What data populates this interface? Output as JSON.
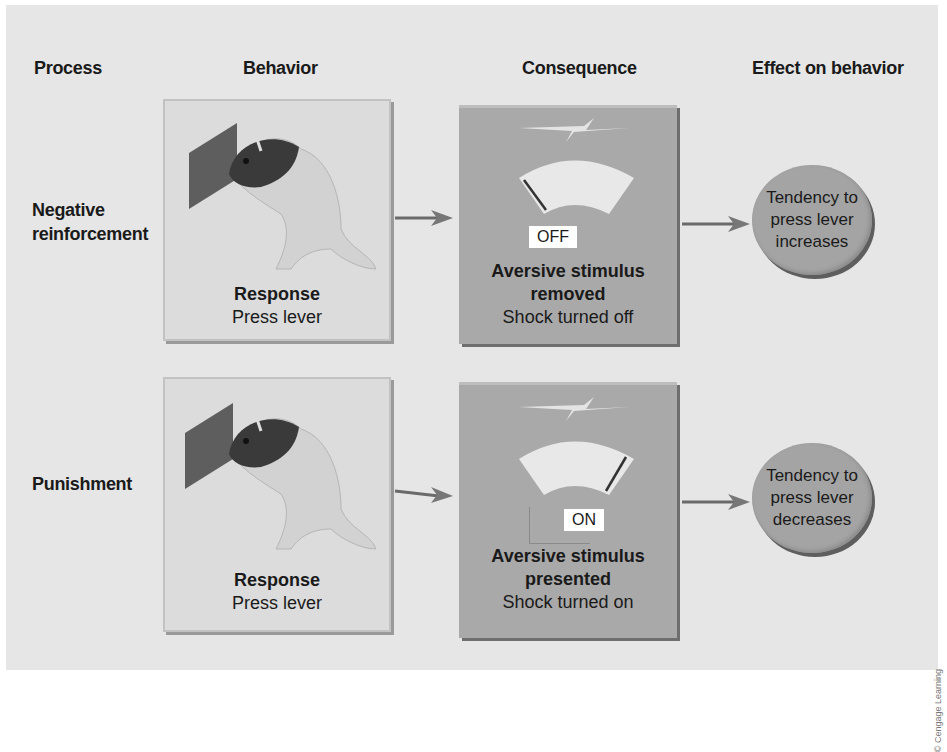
{
  "headers": {
    "process": "Process",
    "behavior": "Behavior",
    "consequence": "Consequence",
    "effect": "Effect on behavior"
  },
  "rows": [
    {
      "process": [
        "Negative",
        "reinforcement"
      ],
      "behavior": {
        "title": "Response",
        "subtitle": "Press lever",
        "icon": "rat-pressing-lever-icon"
      },
      "consequence": {
        "switch_label": "OFF",
        "title": [
          "Aversive stimulus",
          "removed"
        ],
        "subtitle": "Shock turned off",
        "gauge_state": "low",
        "icon": "lightning-bolt-icon"
      },
      "effect": [
        "Tendency to",
        "press lever",
        "increases"
      ]
    },
    {
      "process": [
        "Punishment"
      ],
      "behavior": {
        "title": "Response",
        "subtitle": "Press lever",
        "icon": "rat-pressing-lever-icon"
      },
      "consequence": {
        "switch_label": "ON",
        "title": [
          "Aversive stimulus",
          "presented"
        ],
        "subtitle": "Shock turned on",
        "gauge_state": "high",
        "icon": "lightning-bolt-icon"
      },
      "effect": [
        "Tendency to",
        "press lever",
        "decreases"
      ]
    }
  ],
  "colors": {
    "panel": "#e6e6e6",
    "behavior_box": "#dcdcdc",
    "consequence_box": "#a9a9a9",
    "ellipse": "#a4a4a4",
    "gauge": "#e8e8e8"
  },
  "copyright": "© Cengage Learning"
}
